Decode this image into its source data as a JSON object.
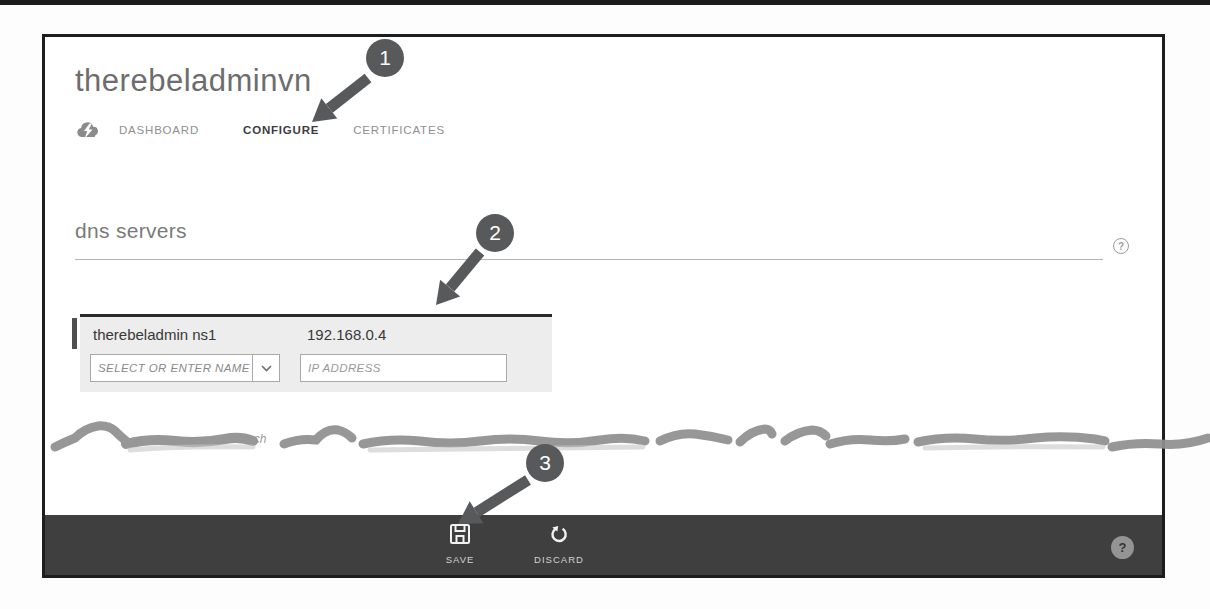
{
  "header": {
    "title": "therebeladminvn",
    "tabs": [
      {
        "label": "DASHBOARD",
        "active": false
      },
      {
        "label": "CONFIGURE",
        "active": true
      },
      {
        "label": "CERTIFICATES",
        "active": false
      }
    ]
  },
  "sections": {
    "dns": {
      "heading": "dns servers",
      "help_label": "?"
    }
  },
  "dns_table": {
    "rows": [
      {
        "name": "therebeladmin ns1",
        "ip": "192.168.0.4"
      }
    ],
    "name_placeholder": "SELECT OR ENTER NAME",
    "ip_placeholder": "IP ADDRESS"
  },
  "torn": {
    "partial_text": "ach"
  },
  "command_bar": {
    "save": "SAVE",
    "discard": "DISCARD",
    "help_label": "?"
  },
  "callouts": [
    {
      "number": "1"
    },
    {
      "number": "2"
    },
    {
      "number": "3"
    }
  ],
  "colors": {
    "command_bar_bg": "#3f3f3f",
    "callout": "#58595b",
    "row_bg": "#ededed",
    "row_accent": "#4f4f4f",
    "frame_border": "#1d1d1d"
  }
}
